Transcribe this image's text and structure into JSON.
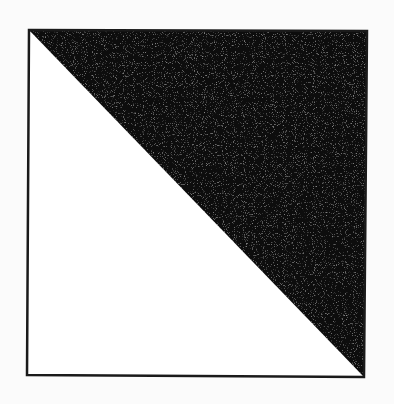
{
  "figure": {
    "colors": {
      "background": "#fbfbfb",
      "outline": "#1a1a1a",
      "filled_triangle": "#111111",
      "empty_triangle": "#ffffff"
    },
    "square": {
      "corners": {
        "top_left": [
          29,
          30
        ],
        "top_right": [
          367,
          31
        ],
        "bottom_right": [
          364,
          377
        ],
        "bottom_left": [
          27,
          375
        ]
      },
      "stroke_width": 2.5
    },
    "diagonal": {
      "from": "top_left",
      "to": "bottom_right"
    },
    "triangles": [
      {
        "name": "upper-right",
        "fill": "filled",
        "vertices": [
          "top_left",
          "top_right",
          "bottom_right"
        ]
      },
      {
        "name": "lower-left",
        "fill": "empty",
        "vertices": [
          "top_left",
          "bottom_right",
          "bottom_left"
        ]
      }
    ]
  }
}
